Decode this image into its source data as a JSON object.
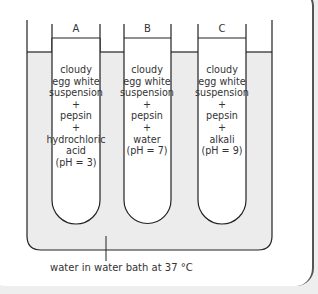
{
  "diagram": {
    "type": "experimental-setup",
    "tubes": [
      {
        "label": "A",
        "contents": [
          "cloudy",
          "egg white",
          "suspension",
          "+",
          "pepsin",
          "+",
          "hydrochloric",
          "acid",
          "(pH = 3)"
        ]
      },
      {
        "label": "B",
        "contents": [
          "cloudy",
          "egg white",
          "suspension",
          "+",
          "pepsin",
          "+",
          "water",
          "(pH = 7)"
        ]
      },
      {
        "label": "C",
        "contents": [
          "cloudy",
          "egg white",
          "suspension",
          "+",
          "pepsin",
          "+",
          "alkali",
          "(pH = 9)"
        ]
      }
    ],
    "water_bath_label": "water in water bath at 37 °C",
    "colors": {
      "water": "#ececec",
      "line": "#222222",
      "background": "#ffffff"
    }
  }
}
